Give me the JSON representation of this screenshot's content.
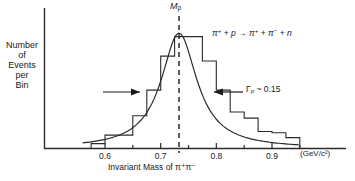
{
  "chart_data": {
    "type": "bar",
    "title": "",
    "xlabel": "Invariant Mass of π⁺π⁻",
    "xunits": "(GeV/c²)",
    "ylabel_lines": [
      "Number",
      "of",
      "Events",
      "per",
      "Bin"
    ],
    "xlim": [
      0.56,
      0.95
    ],
    "ylim": [
      0,
      100
    ],
    "xticks": [
      0.6,
      0.7,
      0.8,
      0.9
    ],
    "xtick_labels": [
      "0.6",
      "0.7",
      "0.8",
      "0.9"
    ],
    "minor_xticks": [
      0.65,
      0.75,
      0.85,
      0.95
    ],
    "grid": false,
    "legend": "none",
    "bin_width": 0.025,
    "bin_edges": [
      0.575,
      0.6,
      0.625,
      0.65,
      0.675,
      0.7,
      0.725,
      0.75,
      0.775,
      0.8,
      0.825,
      0.85,
      0.875,
      0.9,
      0.925,
      0.95
    ],
    "values": [
      4,
      11,
      11,
      27,
      48,
      76,
      92,
      92,
      72,
      48,
      30,
      25,
      14,
      13,
      9
    ],
    "curve_label": "Breit-Wigner fit",
    "curve": {
      "peak_mass": 0.733,
      "width": 0.15,
      "peak_value": 95
    },
    "annotations": [
      {
        "name": "resonance-mass",
        "text": "Mρ",
        "value": 0.733
      },
      {
        "name": "resonance-width",
        "text": "Γρ ~ 0.15",
        "value": 0.15
      },
      {
        "name": "reaction",
        "text": "π⁺ + p → π⁺ + π⁻ + n"
      }
    ]
  },
  "labels": {
    "y_axis": [
      "Number",
      "of",
      "Events",
      "per",
      "Bin"
    ],
    "x_axis": "Invariant Mass of",
    "x_axis_particles": "π⁺π⁻",
    "x_units": "(GeV/c²)",
    "mass_marker": "M",
    "mass_marker_sub": "ρ",
    "width_marker": "Γ",
    "width_marker_sub": "ρ",
    "width_value": "~ 0.15",
    "reaction": {
      "p1": "π",
      "p1s": "+",
      "plus1": "+",
      "target": "p",
      "arrow": "→",
      "o1": "π",
      "o1s": "+",
      "plus2": "+",
      "o2": "π",
      "o2s": "−",
      "plus3": "+",
      "o3": "n"
    },
    "ticks": [
      "0.6",
      "0.7",
      "0.8",
      "0.9"
    ]
  },
  "colors": {
    "axis": "#2b2b2b",
    "histogram": "#2b2b2b",
    "curve": "#2b2b2b",
    "dashed": "#2b2b2b",
    "background": "#ffffff"
  }
}
